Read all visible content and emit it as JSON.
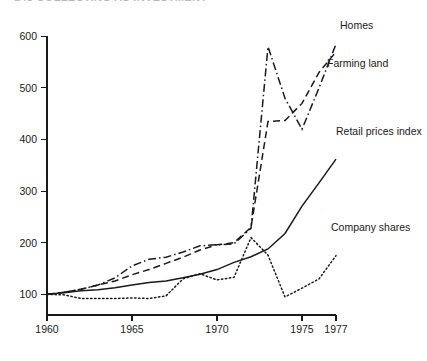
{
  "header": {
    "running_head": "148    COLLECTING AS INVESTMENT"
  },
  "chart_data": {
    "type": "line",
    "title": "",
    "subtitle": "",
    "xlabel": "",
    "ylabel": "",
    "x": [
      1960,
      1961,
      1962,
      1963,
      1964,
      1965,
      1966,
      1967,
      1968,
      1969,
      1970,
      1971,
      1972,
      1973,
      1974,
      1975,
      1976,
      1977
    ],
    "xlim": [
      1960,
      1977
    ],
    "ylim": [
      60,
      620
    ],
    "x_ticks": [
      1960,
      1965,
      1970,
      1975,
      1977
    ],
    "x_tick_labels": [
      "1960",
      "1965",
      "1970",
      "1975",
      "1977"
    ],
    "y_ticks": [
      100,
      200,
      300,
      400,
      500,
      600
    ],
    "y_tick_labels": [
      "100",
      "200",
      "300",
      "400",
      "500",
      "600"
    ],
    "grid": false,
    "legend_position": "inline-right-of-line-ends",
    "series": [
      {
        "name": "Homes",
        "label": "Homes",
        "style": "dash-dot",
        "color": "#1a1a1a",
        "values": [
          100,
          104,
          110,
          118,
          132,
          155,
          168,
          172,
          182,
          194,
          196,
          198,
          228,
          580,
          480,
          420,
          500,
          585
        ]
      },
      {
        "name": "Farming land",
        "label": "Farming land",
        "style": "dashed",
        "color": "#1a1a1a",
        "values": [
          100,
          104,
          110,
          118,
          126,
          138,
          148,
          160,
          172,
          186,
          196,
          200,
          230,
          435,
          437,
          470,
          530,
          570
        ]
      },
      {
        "name": "Retail prices index",
        "label": "Retail prices index",
        "style": "solid",
        "color": "#1a1a1a",
        "values": [
          100,
          103,
          107,
          109,
          113,
          118,
          123,
          126,
          132,
          139,
          148,
          162,
          173,
          188,
          218,
          271,
          316,
          362
        ]
      },
      {
        "name": "Company shares",
        "label": "Company shares",
        "style": "dotted",
        "color": "#1a1a1a",
        "values": [
          100,
          99,
          92,
          92,
          92,
          93,
          92,
          97,
          130,
          140,
          128,
          133,
          210,
          176,
          95,
          112,
          130,
          175
        ]
      }
    ]
  }
}
